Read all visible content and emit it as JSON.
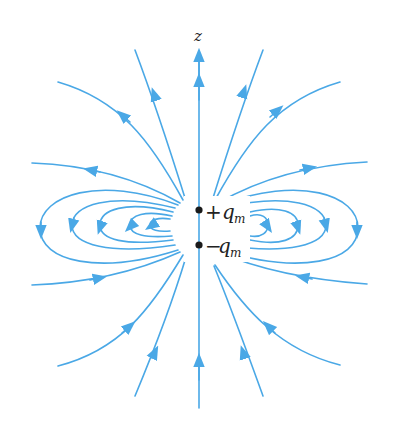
{
  "figure": {
    "axis_label": "z",
    "charges": [
      {
        "sign": "+",
        "symbol": "q",
        "subscript": "m",
        "label": "+q_m",
        "x": 199,
        "y": 210
      },
      {
        "sign": "−",
        "symbol": "q",
        "subscript": "m",
        "label": "−q_m",
        "x": 199,
        "y": 245
      }
    ],
    "colors": {
      "field_line": "#4aa8e6",
      "charge": "#1a1a1a",
      "text": "#222222",
      "background": "#ffffff"
    }
  }
}
